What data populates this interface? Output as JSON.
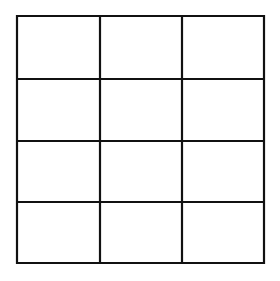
{
  "diagram": {
    "type": "grid",
    "rows": 4,
    "columns": 3,
    "line_color": "#111111",
    "background": "#ffffff",
    "column_lines_x": [
      17,
      100,
      182,
      264
    ],
    "row_lines_y": [
      16,
      79,
      141,
      202,
      263
    ],
    "cells": [
      [
        "",
        "",
        ""
      ],
      [
        "",
        "",
        ""
      ],
      [
        "",
        "",
        ""
      ],
      [
        "",
        "",
        ""
      ]
    ]
  }
}
